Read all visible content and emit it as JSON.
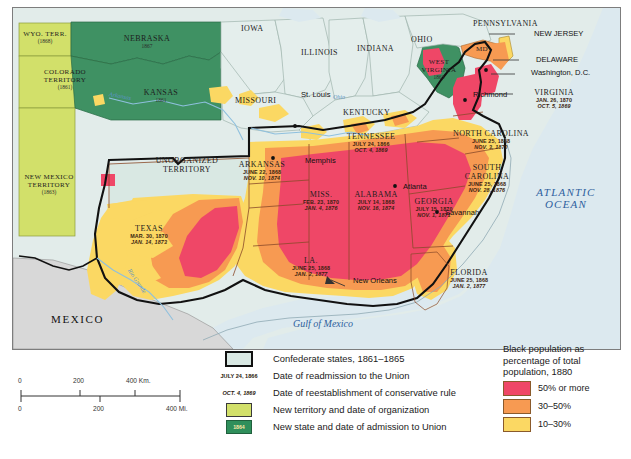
{
  "map": {
    "title": "Reconstruction and Black Population, 1880",
    "ocean_label": "ATLANTIC OCEAN",
    "ocean_line1": "ATLANTIC",
    "ocean_line2": "OCEAN",
    "gulf_label": "Gulf of Mexico",
    "mexico_label": "MEXICO",
    "rivers": [
      {
        "name": "Arkansas"
      },
      {
        "name": "Ohio"
      },
      {
        "name": "Rio Grande"
      }
    ],
    "cities": [
      {
        "name": "St. Louis"
      },
      {
        "name": "Memphis"
      },
      {
        "name": "Atlanta"
      },
      {
        "name": "Savannah"
      },
      {
        "name": "New Orleans"
      },
      {
        "name": "Richmond"
      },
      {
        "name": "Washington, D.C."
      }
    ],
    "callouts": [
      {
        "name": "NEW JERSEY"
      },
      {
        "name": "DELAWARE"
      },
      {
        "name": "Washington, D.C."
      },
      {
        "name": "VIRGINIA"
      }
    ],
    "plain_states": [
      {
        "name": "IOWA"
      },
      {
        "name": "ILLINOIS"
      },
      {
        "name": "INDIANA"
      },
      {
        "name": "OHIO"
      },
      {
        "name": "MISSOURI"
      },
      {
        "name": "KENTUCKY"
      },
      {
        "name": "PENNSYLVANIA"
      },
      {
        "name": "MD"
      },
      {
        "name": "UNORGANIZED TERRITORY"
      },
      {
        "name": "UNORGANIZED"
      },
      {
        "name": "TERRITORY"
      }
    ],
    "territories": [
      {
        "name": "WYO. TERR.",
        "date": "(1868)"
      },
      {
        "name": "COLORADO TERRITORY",
        "line1": "COLORADO",
        "line2": "TERRITORY",
        "date": "(1861)"
      },
      {
        "name": "NEW MEXICO TERRITORY",
        "line1": "NEW MEXICO",
        "line2": "TERRITORY",
        "date": "(1863)"
      }
    ],
    "new_states": [
      {
        "name": "NEBRASKA",
        "date": "1867"
      },
      {
        "name": "KANSAS",
        "date": "1861"
      },
      {
        "name": "WEST VIRGINIA",
        "line1": "WEST",
        "line2": "VIRGINIA",
        "date": "1863"
      }
    ],
    "confederate_states": [
      {
        "name": "VIRGINIA",
        "readmission": "JAN. 26, 1870",
        "conservative": "OCT. 5, 1869"
      },
      {
        "name": "NORTH CAROLINA",
        "readmission": "JUNE 25, 1868",
        "conservative": "NOV. 3, 1870"
      },
      {
        "name": "SOUTH CAROLINA",
        "line1": "SOUTH",
        "line2": "CAROLINA",
        "readmission": "JUNE 25, 1868",
        "conservative": "NOV. 28, 1876"
      },
      {
        "name": "GEORGIA",
        "readmission": "JULY 15, 1870",
        "conservative": "NOV. 1, 1871"
      },
      {
        "name": "FLORIDA",
        "readmission": "JUNE 25, 1868",
        "conservative": "JAN. 2, 1877"
      },
      {
        "name": "ALABAMA",
        "readmission": "JULY 14, 1868",
        "conservative": "NOV. 16, 1874"
      },
      {
        "name": "MISS.",
        "readmission": "FEB. 23, 1870",
        "conservative": "JAN. 4, 1876"
      },
      {
        "name": "LA.",
        "readmission": "JUNE 25, 1868",
        "conservative": "JAN. 2, 1877"
      },
      {
        "name": "TEXAS",
        "readmission": "MAR. 30, 1870",
        "conservative": "JAN. 14, 1873"
      },
      {
        "name": "ARKANSAS",
        "readmission": "JUNE 22, 1868",
        "conservative": "NOV. 10, 1874"
      },
      {
        "name": "TENNESSEE",
        "readmission": "JULY 24, 1866",
        "conservative": "OCT. 4, 1869"
      }
    ]
  },
  "legend": {
    "rows": [
      {
        "key_type": "swatch-confederate",
        "key_text": "",
        "text": "Confederate states, 1861–1865"
      },
      {
        "key_type": "date-roman",
        "key_text": "JULY 24, 1866",
        "text": "Date of readmission to the Union"
      },
      {
        "key_type": "date-italic",
        "key_text": "OCT. 4, 1869",
        "text": "Date of reestablishment of conservative rule"
      },
      {
        "key_type": "swatch-territory",
        "key_text": "",
        "text": "New territory and date of organization"
      },
      {
        "key_type": "swatch-newstate",
        "key_text": "1864",
        "text": "New state and date of admission to Union"
      }
    ]
  },
  "pop_legend": {
    "title_line1": "Black population as",
    "title_line2": "percentage of total",
    "title_line3": "population, 1880",
    "items": [
      {
        "label": "50% or more",
        "color": "#ef4767"
      },
      {
        "label": "30–50%",
        "color": "#f79a52"
      },
      {
        "label": "10–30%",
        "color": "#fbd863"
      }
    ]
  },
  "scale": {
    "km_ticks": [
      "0",
      "200",
      "400 Km."
    ],
    "mi_ticks": [
      "0",
      "200",
      "400 Mi."
    ]
  },
  "colors": {
    "pop_50": "#ef4767",
    "pop_30": "#f79a52",
    "pop_10": "#fbd863",
    "confederate_base": "#d9e8e3",
    "new_state": "#3f9163",
    "new_territory": "#d2e06a",
    "ocean": "#dce9ef",
    "mexico": "#d8d8d8",
    "non_confederate": "#e2ecea",
    "text_dark": "#1d1d1d",
    "ocean_text": "#2e5f9e"
  }
}
